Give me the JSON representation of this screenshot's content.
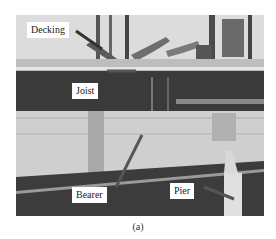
{
  "figure": {
    "panel": "photograph",
    "caption": "(a)",
    "labels": {
      "decking": "Decking",
      "joist": "Joist",
      "bearer": "Bearer",
      "pier": "Pier"
    }
  }
}
